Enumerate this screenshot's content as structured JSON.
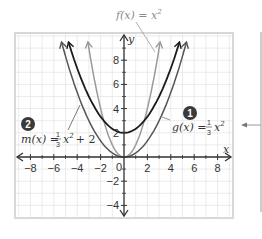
{
  "chart_data": {
    "type": "line",
    "title": "",
    "xlabel": "x",
    "ylabel": "y",
    "xlim": [
      -8.5,
      8.9
    ],
    "ylim": [
      -5.1,
      10.2
    ],
    "grid": true,
    "x_ticks": [
      -8,
      -6,
      -4,
      -2,
      2,
      4,
      6,
      8
    ],
    "y_ticks": [
      8,
      6,
      4,
      2,
      -2,
      -4
    ],
    "origin_label": "0",
    "series": [
      {
        "name": "f(x) = x^2",
        "label_main": "f(x) = x",
        "label_exp": "2",
        "expr": "x^2",
        "a": 1,
        "k": 0,
        "color": "#9a9a9a"
      },
      {
        "name": "g(x) = 1/3 x^2",
        "label_prefix": "g(x) =",
        "frac_num": "1",
        "frac_den": "3",
        "label_suffix": "x",
        "label_exp": "2",
        "expr": "(1/3)x^2",
        "a": 0.3333,
        "k": 0,
        "color": "#555555",
        "marker": "1"
      },
      {
        "name": "m(x) = 1/3 x^2 + 2",
        "label_prefix": "m(x) =",
        "frac_num": "1",
        "frac_den": "3",
        "label_suffix": "x",
        "label_exp": "2",
        "label_tail": "+ 2",
        "expr": "(1/3)x^2 + 2",
        "a": 0.3333,
        "k": 2,
        "color": "#1a1a1a",
        "marker": "2"
      }
    ]
  },
  "colors": {
    "grid": "#e6e6e6",
    "axis": "#333333",
    "frame": "#d8d8d8",
    "marker_bg": "#3a3a3a"
  }
}
